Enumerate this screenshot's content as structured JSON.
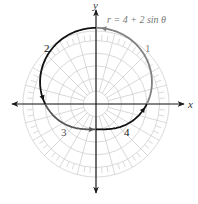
{
  "diagram": {
    "equation_label": "r = 4 + 2 sin θ",
    "axes": {
      "x_label": "x",
      "y_label": "y"
    },
    "segment_labels": [
      {
        "id": "1",
        "text": "1",
        "color": "#808080"
      },
      {
        "id": "2",
        "text": "2",
        "color": "#111111"
      },
      {
        "id": "3",
        "text": "3",
        "color": "#555555"
      },
      {
        "id": "4",
        "text": "4",
        "color": "#111111"
      }
    ],
    "colors": {
      "grid": "#cfcfcf",
      "axis": "#1a1a1a",
      "segment_1": "#808080",
      "segment_2": "#111111",
      "segment_3": "#555555",
      "segment_4": "#111111"
    }
  },
  "chart_data": {
    "type": "polar",
    "equation": "r = 4 + 2 sin θ",
    "curve": "limaçon (dimpled/convex)",
    "theta_range_deg": [
      0,
      360
    ],
    "grid": {
      "circles_r": [
        1,
        2,
        3,
        4,
        5
      ],
      "tick_ring_r": [
        5,
        5.75
      ],
      "radial_step_deg": 15
    },
    "key_points": [
      {
        "theta_deg": 0,
        "r": 4
      },
      {
        "theta_deg": 90,
        "r": 6
      },
      {
        "theta_deg": 180,
        "r": 4
      },
      {
        "theta_deg": 270,
        "r": 2
      }
    ],
    "segments": [
      {
        "label": "1",
        "theta_deg": [
          0,
          90
        ]
      },
      {
        "label": "2",
        "theta_deg": [
          90,
          180
        ]
      },
      {
        "label": "3",
        "theta_deg": [
          180,
          270
        ]
      },
      {
        "label": "4",
        "theta_deg": [
          270,
          360
        ]
      }
    ],
    "xlabel": "x",
    "ylabel": "y"
  }
}
